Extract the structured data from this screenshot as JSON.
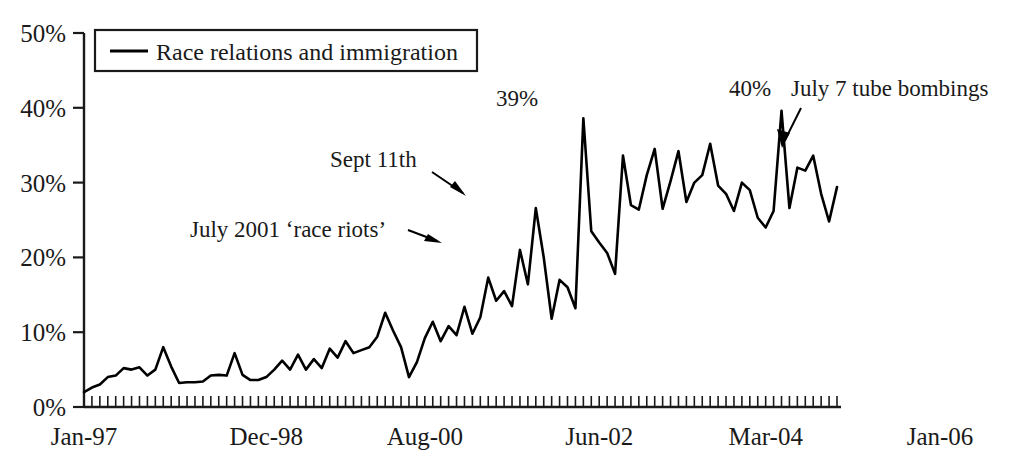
{
  "chart_data": {
    "type": "line",
    "title": "",
    "xlabel": "",
    "ylabel": "",
    "ylim": [
      0,
      50
    ],
    "y_ticks": [
      "0%",
      "10%",
      "20%",
      "30%",
      "40%",
      "50%"
    ],
    "y_tick_values": [
      0,
      10,
      20,
      30,
      40,
      50
    ],
    "x_ticks": [
      "Jan-97",
      "Dec-98",
      "Aug-00",
      "Jun-02",
      "Mar-04",
      "Jan-06"
    ],
    "x_tick_index": [
      0,
      23,
      43,
      65,
      86,
      108
    ],
    "grid": false,
    "legend_position": "top-left",
    "series": [
      {
        "name": "Race relations and immigration",
        "color": "#000000",
        "values": [
          2.0,
          2.6,
          3.0,
          4.0,
          4.2,
          5.2,
          5.0,
          5.3,
          4.2,
          5.0,
          8.0,
          5.4,
          3.2,
          3.3,
          3.3,
          3.4,
          4.2,
          4.3,
          4.2,
          7.2,
          4.3,
          3.6,
          3.6,
          4.0,
          5.0,
          6.2,
          5.0,
          7.0,
          5.0,
          6.4,
          5.2,
          7.8,
          6.6,
          8.8,
          7.2,
          7.6,
          8.0,
          9.4,
          12.6,
          10.2,
          8.0,
          4.0,
          6.0,
          9.2,
          11.4,
          8.8,
          10.8,
          9.6,
          13.4,
          9.8,
          12.0,
          17.3,
          14.2,
          15.5,
          13.5,
          21.0,
          16.4,
          26.6,
          20.0,
          11.8,
          17.0,
          16.0,
          13.2,
          38.6,
          23.5,
          22.0,
          20.6,
          17.8,
          33.6,
          27.0,
          26.4,
          31.0,
          34.5,
          26.5,
          30.2,
          34.2,
          27.4,
          30.0,
          31.0,
          35.2,
          29.6,
          28.5,
          26.2,
          30.0,
          29.0,
          25.3,
          24.0,
          26.2,
          39.6,
          26.6,
          32.0,
          31.6,
          33.6,
          28.5,
          24.8,
          29.4
        ]
      }
    ],
    "annotations": [
      {
        "id": "sept-11th",
        "text": "Sept 11th"
      },
      {
        "id": "race-riots",
        "text": "July 2001 ‘race riots’"
      },
      {
        "id": "peak-39",
        "text": "39%"
      },
      {
        "id": "peak-40",
        "text": "40%"
      },
      {
        "id": "tube-bombings",
        "text": "July 7 tube bombings"
      }
    ]
  },
  "legend": {
    "label": "Race relations and immigration"
  },
  "axes": {
    "y0": "0%",
    "y10": "10%",
    "y20": "20%",
    "y30": "30%",
    "y40": "40%",
    "y50": "50%",
    "x0": "Jan-97",
    "x1": "Dec-98",
    "x2": "Aug-00",
    "x3": "Jun-02",
    "x4": "Mar-04",
    "x5": "Jan-06"
  },
  "annotations": {
    "sept11": "Sept 11th",
    "race_riots": "July 2001 ‘race riots’",
    "peak39": "39%",
    "peak40": "40%",
    "tube_bombings": "July 7 tube bombings"
  },
  "colors": {
    "line": "#000000",
    "axis": "#1a1a1a",
    "background": "#ffffff"
  }
}
